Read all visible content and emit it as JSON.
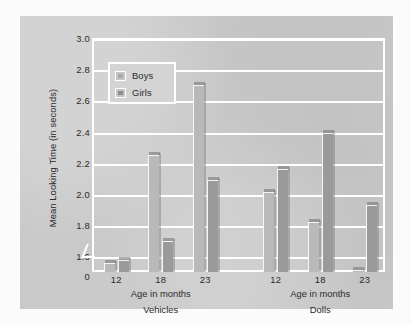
{
  "chart_data": {
    "type": "bar",
    "title": "",
    "xlabel": "Age in months",
    "ylabel": "Mean Looking Time (in seconds)",
    "ylim": [
      1.5,
      3.0
    ],
    "yticks": [
      "0",
      "1.6",
      "1.8",
      "2.0",
      "2.2",
      "2.4",
      "2.6",
      "2.8",
      "3.0"
    ],
    "grid": true,
    "legend_position": "upper-left-inside",
    "axis_break": true,
    "panels": [
      {
        "name": "Vehicles",
        "xlabel": "Age in months",
        "categories": [
          "12",
          "18",
          "23"
        ],
        "series": [
          {
            "name": "Boys",
            "values": [
              1.56,
              2.25,
              2.7
            ]
          },
          {
            "name": "Girls",
            "values": [
              1.58,
              1.7,
              2.09
            ]
          }
        ]
      },
      {
        "name": "Dolls",
        "xlabel": "Age in months",
        "categories": [
          "12",
          "18",
          "23"
        ],
        "series": [
          {
            "name": "Boys",
            "values": [
              2.01,
              1.82,
              1.51
            ]
          },
          {
            "name": "Girls",
            "values": [
              2.16,
              2.39,
              1.93
            ]
          }
        ]
      }
    ],
    "legend": [
      {
        "label": "Boys",
        "color": "#b9b9b9"
      },
      {
        "label": "Girls",
        "color": "#9a9a9a"
      }
    ],
    "colors": {
      "panel_background": "#c9c9c9",
      "page_background": "#fbfbfb",
      "gridline": "#ffffff",
      "boys_bar": "#b9b9b9",
      "girls_bar": "#9a9a9a",
      "text": "#2a2a2a"
    }
  }
}
